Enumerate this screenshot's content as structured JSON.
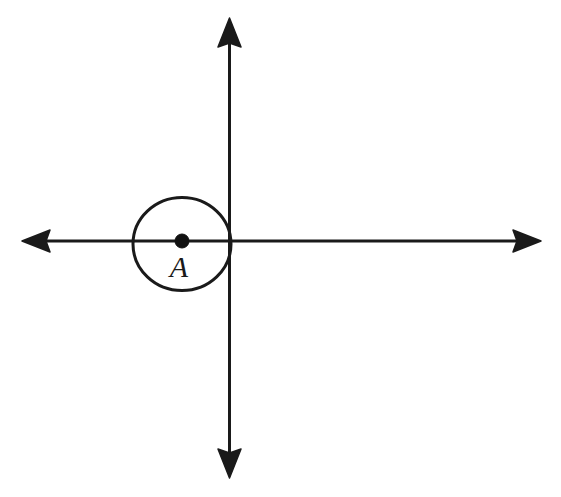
{
  "figure": {
    "background_color": "#ffffff",
    "stroke_color": "#1a1a1a",
    "canvas": {
      "width": 561,
      "height": 497
    },
    "axes": {
      "horizontal": {
        "name": "x-axis",
        "y": 241,
        "x_start": 22,
        "x_end": 541,
        "stroke_width": 3,
        "arrowheads": [
          "left",
          "right"
        ],
        "arrow_length": 26,
        "arrow_half_width": 11
      },
      "vertical": {
        "name": "y-axis",
        "x": 229,
        "y_start": 18,
        "y_end": 478,
        "stroke_width": 3,
        "arrowheads": [
          "up",
          "down"
        ],
        "arrow_length": 26,
        "arrow_half_width": 11
      },
      "origin": {
        "x": 229,
        "y": 241
      }
    },
    "circle": {
      "name": "circle-A",
      "center": {
        "x": 182,
        "y": 244
      },
      "radius_x": 49,
      "radius_y": 46.5,
      "stroke_width": 3,
      "fill": "none"
    },
    "center_point": {
      "name": "center-dot",
      "x": 182,
      "y": 241,
      "radius": 7,
      "fill": "#111111"
    },
    "label": {
      "text": "A",
      "x": 179,
      "y": 277,
      "font_size": 30,
      "style": "italic"
    }
  }
}
